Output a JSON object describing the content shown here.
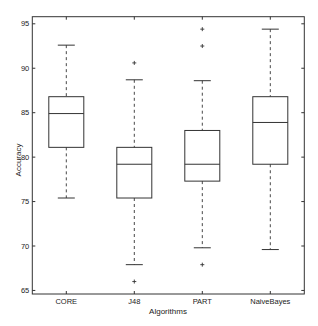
{
  "chart_data": {
    "type": "box",
    "title": "",
    "xlabel": "Algorithms",
    "ylabel": "Accuracy",
    "ylim": [
      64.6,
      95.8
    ],
    "yticks": [
      65,
      70,
      75,
      80,
      85,
      90,
      95
    ],
    "grid": false,
    "legend": null,
    "categories": [
      "CORE",
      "J48",
      "PART",
      "NaiveBayes"
    ],
    "boxes": [
      {
        "name": "CORE",
        "whisker_low": 75.4,
        "q1": 81.1,
        "median": 84.9,
        "q3": 86.8,
        "whisker_high": 92.6,
        "outliers": []
      },
      {
        "name": "J48",
        "whisker_low": 67.9,
        "q1": 75.4,
        "median": 79.2,
        "q3": 81.1,
        "whisker_high": 88.7,
        "outliers": [
          90.6,
          66.0
        ]
      },
      {
        "name": "PART",
        "whisker_low": 69.8,
        "q1": 77.3,
        "median": 79.2,
        "q3": 83.0,
        "whisker_high": 88.6,
        "outliers": [
          94.4,
          92.5,
          67.9
        ]
      },
      {
        "name": "NaiveBayes",
        "whisker_low": 69.6,
        "q1": 79.2,
        "median": 83.9,
        "q3": 86.8,
        "whisker_high": 94.4,
        "outliers": []
      }
    ]
  },
  "colors": {
    "line": "#333333",
    "background": "#ffffff"
  }
}
